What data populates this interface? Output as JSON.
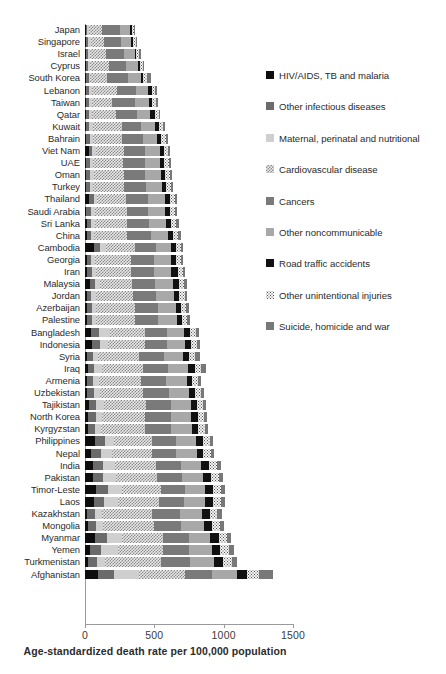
{
  "chart_data": {
    "type": "bar",
    "orientation": "horizontal",
    "stacked": true,
    "title": "",
    "xlabel": "Age-standardized death rate per 100,000 population",
    "ylabel": "",
    "xlim": [
      0,
      1500
    ],
    "xticks": [
      0,
      500,
      1000,
      1500
    ],
    "grid": false,
    "legend_position": "right",
    "series": [
      {
        "name": "HIV/AIDS, TB and malaria",
        "color": "#0d0d0d"
      },
      {
        "name": "Other infectious diseases",
        "color": "#6b6b6b"
      },
      {
        "name": "Maternal, perinatal and nutritional",
        "color": "#cfcfcf"
      },
      {
        "name": "Cardiovascular disease",
        "color": "#8a8a8a"
      },
      {
        "name": "Cancers",
        "color": "#7a7a7a"
      },
      {
        "name": "Other noncommunicable",
        "color": "#a8a8a8"
      },
      {
        "name": "Road traffic accidents",
        "color": "#111111"
      },
      {
        "name": "Other unintentional injuries",
        "color": "#f2f2f2"
      },
      {
        "name": "Suicide, homicide and war",
        "color": "#787878"
      }
    ],
    "categories": [
      "Japan",
      "Singapore",
      "Israel",
      "Cyprus",
      "South Korea",
      "Lebanon",
      "Taiwan",
      "Qatar",
      "Kuwait",
      "Bahrain",
      "Viet Nam",
      "UAE",
      "Oman",
      "Turkey",
      "Thailand",
      "Saudi Arabia",
      "Sri Lanka",
      "China",
      "Cambodia",
      "Georgia",
      "Iran",
      "Malaysia",
      "Jordan",
      "Azerbaijan",
      "Palestine",
      "Bangladesh",
      "Indonesia",
      "Syria",
      "Iraq",
      "Armenia",
      "Uzbekistan",
      "Tajikistan",
      "North Korea",
      "Kyrgyzstan",
      "Philippines",
      "Nepal",
      "India",
      "Pakistan",
      "Timor-Leste",
      "Laos",
      "Kazakhstan",
      "Mongolia",
      "Myanmar",
      "Yemen",
      "Turkmenistan",
      "Afghanistan"
    ],
    "values": [
      [
        5,
        12,
        9,
        100,
        128,
        72,
        12,
        18,
        8
      ],
      [
        5,
        14,
        24,
        96,
        120,
        76,
        14,
        20,
        9
      ],
      [
        6,
        16,
        11,
        118,
        128,
        80,
        12,
        22,
        10
      ],
      [
        5,
        14,
        14,
        140,
        126,
        84,
        14,
        22,
        10
      ],
      [
        7,
        20,
        12,
        118,
        150,
        96,
        16,
        30,
        30
      ],
      [
        8,
        22,
        18,
        182,
        136,
        92,
        22,
        26,
        12
      ],
      [
        8,
        24,
        16,
        150,
        164,
        100,
        20,
        28,
        14
      ],
      [
        9,
        20,
        20,
        176,
        150,
        96,
        32,
        30,
        12
      ],
      [
        8,
        24,
        26,
        208,
        140,
        96,
        30,
        30,
        12
      ],
      [
        10,
        26,
        24,
        208,
        150,
        104,
        28,
        32,
        14
      ],
      [
        26,
        28,
        26,
        198,
        156,
        104,
        30,
        32,
        14
      ],
      [
        9,
        26,
        24,
        216,
        156,
        108,
        32,
        34,
        14
      ],
      [
        10,
        28,
        28,
        216,
        154,
        110,
        32,
        34,
        14
      ],
      [
        9,
        26,
        22,
        224,
        160,
        116,
        30,
        34,
        14
      ],
      [
        30,
        34,
        26,
        206,
        160,
        118,
        36,
        36,
        18
      ],
      [
        10,
        30,
        30,
        232,
        156,
        118,
        40,
        36,
        14
      ],
      [
        12,
        34,
        28,
        228,
        162,
        120,
        38,
        38,
        18
      ],
      [
        12,
        30,
        26,
        238,
        172,
        122,
        34,
        36,
        20
      ],
      [
        62,
        46,
        46,
        206,
        150,
        110,
        36,
        38,
        16
      ],
      [
        12,
        32,
        28,
        262,
        166,
        124,
        30,
        36,
        16
      ],
      [
        14,
        34,
        32,
        250,
        166,
        128,
        44,
        38,
        18
      ],
      [
        34,
        40,
        32,
        230,
        168,
        128,
        46,
        40,
        18
      ],
      [
        12,
        34,
        30,
        268,
        168,
        130,
        38,
        38,
        18
      ],
      [
        14,
        36,
        32,
        276,
        168,
        132,
        34,
        38,
        18
      ],
      [
        12,
        36,
        34,
        276,
        170,
        134,
        36,
        40,
        18
      ],
      [
        46,
        56,
        76,
        252,
        158,
        128,
        40,
        44,
        20
      ],
      [
        48,
        58,
        62,
        262,
        162,
        132,
        42,
        44,
        20
      ],
      [
        14,
        42,
        38,
        296,
        180,
        140,
        42,
        44,
        36
      ],
      [
        20,
        48,
        52,
        300,
        180,
        146,
        46,
        46,
        34
      ],
      [
        16,
        44,
        40,
        306,
        182,
        146,
        40,
        44,
        20
      ],
      [
        18,
        46,
        44,
        312,
        184,
        148,
        42,
        46,
        22
      ],
      [
        26,
        54,
        58,
        300,
        180,
        144,
        44,
        48,
        22
      ],
      [
        24,
        52,
        50,
        310,
        184,
        148,
        44,
        48,
        24
      ],
      [
        20,
        50,
        46,
        318,
        186,
        150,
        46,
        48,
        24
      ],
      [
        72,
        74,
        66,
        272,
        176,
        142,
        48,
        52,
        24
      ],
      [
        46,
        66,
        86,
        286,
        176,
        146,
        48,
        54,
        24
      ],
      [
        58,
        70,
        92,
        292,
        178,
        148,
        58,
        56,
        26
      ],
      [
        56,
        72,
        96,
        296,
        180,
        150,
        62,
        58,
        28
      ],
      [
        80,
        86,
        104,
        276,
        176,
        146,
        56,
        58,
        26
      ],
      [
        62,
        78,
        96,
        300,
        180,
        152,
        58,
        58,
        28
      ],
      [
        18,
        54,
        48,
        366,
        196,
        162,
        56,
        56,
        30
      ],
      [
        20,
        56,
        52,
        368,
        198,
        164,
        58,
        58,
        30
      ],
      [
        74,
        84,
        108,
        300,
        184,
        154,
        60,
        62,
        30
      ],
      [
        38,
        76,
        126,
        320,
        192,
        162,
        62,
        66,
        32
      ],
      [
        22,
        62,
        62,
        400,
        210,
        176,
        64,
        66,
        34
      ],
      [
        96,
        112,
        182,
        328,
        200,
        176,
        72,
        92,
        96
      ]
    ]
  },
  "axis": {
    "tick_labels": [
      "0",
      "500",
      "1000",
      "1500"
    ],
    "title": "Age-standardized death rate per 100,000 population"
  },
  "caption": {
    "text": ""
  }
}
